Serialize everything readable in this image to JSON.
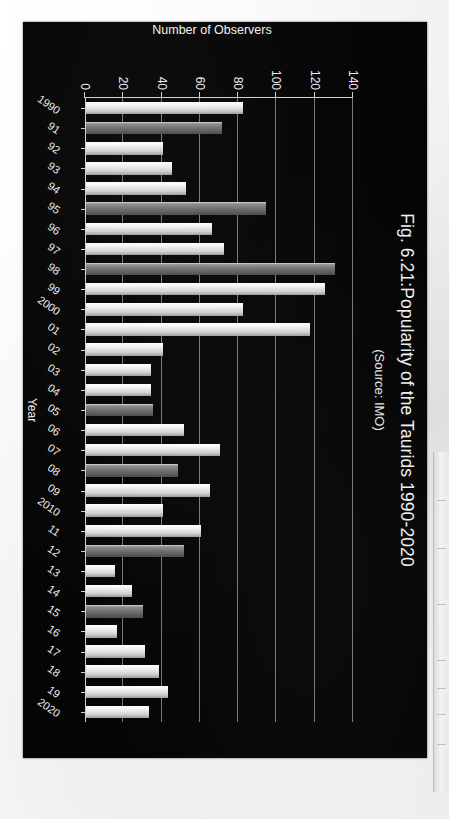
{
  "figure": {
    "title": "Fig. 6.21:Popularity of the Taurids 1990-2020",
    "subtitle": "(Source: IMO)"
  },
  "chart_data": {
    "type": "bar",
    "orientation": "vertical",
    "title": "Fig. 6.21:Popularity of the Taurids 1990-2020",
    "subtitle": "(Source: IMO)",
    "xlabel": "Year",
    "ylabel": "Number of Observers",
    "ylim": [
      0,
      140
    ],
    "yticks": [
      0,
      20,
      40,
      60,
      80,
      100,
      120,
      140
    ],
    "grid": true,
    "legend": null,
    "background": "#050505",
    "categories": [
      "1990",
      "91",
      "92",
      "93",
      "94",
      "95",
      "96",
      "97",
      "98",
      "99",
      "2000",
      "01",
      "02",
      "03",
      "04",
      "05",
      "06",
      "07",
      "08",
      "09",
      "2010",
      "11",
      "12",
      "13",
      "14",
      "15",
      "16",
      "17",
      "18",
      "19",
      "2020"
    ],
    "values": [
      82,
      71,
      40,
      45,
      52,
      94,
      66,
      72,
      130,
      125,
      82,
      117,
      40,
      34,
      34,
      35,
      51,
      70,
      48,
      65,
      40,
      60,
      51,
      15,
      24,
      30,
      16,
      31,
      38,
      43,
      33
    ],
    "shades": [
      "light",
      "dark",
      "light",
      "light",
      "light",
      "dark",
      "light",
      "light",
      "dark",
      "light",
      "light",
      "light",
      "light",
      "light",
      "light",
      "dark",
      "light",
      "light",
      "dark",
      "light",
      "light",
      "light",
      "dark",
      "light",
      "light",
      "dark",
      "light",
      "light",
      "light",
      "light",
      "light"
    ],
    "colors": {
      "bar_light": "#f2f2f2",
      "bar_dark": "#6a6a6a",
      "gridline": "#8e8e8e",
      "axis": "#cfcfcf",
      "text": "#ededed",
      "plot_background": "#050505",
      "page_background": "#ffffff"
    }
  }
}
